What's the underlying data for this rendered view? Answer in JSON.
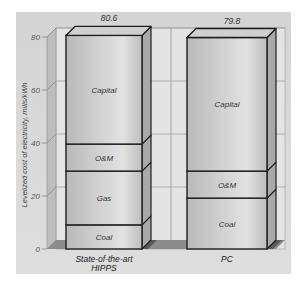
{
  "chart_data": {
    "type": "bar",
    "stacked": true,
    "title": "",
    "xlabel": "",
    "ylabel": "Levelized cost of electricity, mills/kWh",
    "ylim": [
      0,
      80
    ],
    "yticks": [
      0,
      20,
      40,
      60,
      80
    ],
    "grid": true,
    "categories": [
      "State-of-the-art HIPPS",
      "PC"
    ],
    "category_lines": [
      [
        "State-of-the-art",
        "HIPPS"
      ],
      [
        "PC"
      ]
    ],
    "totals": [
      80.6,
      79.8
    ],
    "total_labels": [
      "80.6",
      "79.8"
    ],
    "bars": [
      {
        "category": "State-of-the-art HIPPS",
        "segments": [
          {
            "name": "Coal",
            "value": 9.1
          },
          {
            "name": "Gas",
            "value": 20.3
          },
          {
            "name": "O&M",
            "value": 10.2
          },
          {
            "name": "Capital",
            "value": 41.0
          }
        ]
      },
      {
        "category": "PC",
        "segments": [
          {
            "name": "Coal",
            "value": 19.2
          },
          {
            "name": "O&M",
            "value": 10.2
          },
          {
            "name": "Capital",
            "value": 50.4
          }
        ]
      }
    ],
    "legend": "none (segments labeled in-bar)"
  },
  "colors": {
    "panel": "#d8d8d8",
    "back_wall": "#e4e4e4",
    "bar_front": "#c4c4c4",
    "bar_top": "#cfcfcf",
    "bar_side": "#a9a9a9",
    "outline": "#1e1e1e",
    "floor_shadow": "#5a5a5a"
  }
}
